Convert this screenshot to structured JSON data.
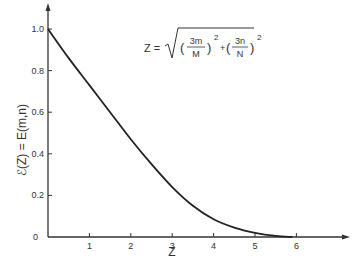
{
  "chart_data": {
    "type": "line",
    "title": "",
    "xlabel": "Z",
    "ylabel": "ℰ(Z) = E(m,n)",
    "annotation": "Z = √((3m/M)² + (3n/N)²)",
    "formula": {
      "lhs": "Z =",
      "term1_num": "3m",
      "term1_den": "M",
      "term2_num": "3n",
      "term2_den": "N",
      "exponent": "2",
      "plus": "+"
    },
    "xlim": [
      0,
      6.6
    ],
    "ylim": [
      0,
      1.1
    ],
    "x_ticks": [
      "1",
      "2",
      "3",
      "4",
      "5",
      "6"
    ],
    "y_ticks": [
      "0",
      "0.2",
      "0.4",
      "0.6",
      "0.8",
      "1.0"
    ],
    "grid": false,
    "legend": null,
    "series": [
      {
        "name": "E(Z)",
        "x": [
          0,
          0.5,
          1,
          1.5,
          2,
          2.5,
          3,
          3.5,
          4,
          4.5,
          5,
          5.5,
          5.9
        ],
        "values": [
          1.0,
          0.86,
          0.73,
          0.6,
          0.47,
          0.35,
          0.24,
          0.15,
          0.085,
          0.045,
          0.02,
          0.005,
          0.0
        ]
      }
    ]
  }
}
